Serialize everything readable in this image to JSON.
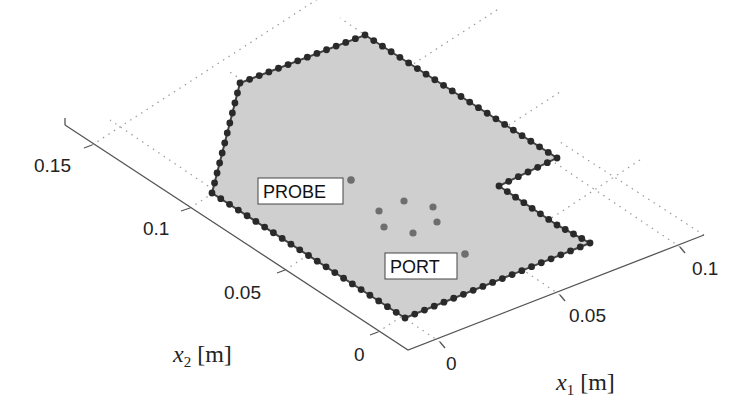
{
  "chart_data": {
    "type": "scatter",
    "title": "",
    "xlabel": "x_1 [m]",
    "ylabel": "x_2 [m]",
    "xlabel_main": "x",
    "xlabel_sub": "1",
    "xlabel_unit": "[m]",
    "ylabel_main": "x",
    "ylabel_sub": "2",
    "ylabel_unit": "[m]",
    "x_ticks": [
      "0",
      "0.05",
      "0.1"
    ],
    "y_ticks": [
      "0",
      "0.05",
      "0.1",
      "0.15"
    ],
    "xlim": [
      0,
      0.11
    ],
    "ylim": [
      0,
      0.17
    ],
    "grid": "dotted",
    "view": "3D perspective",
    "domain_shape": "polygon with rectangular notch, boundary discretized by dots",
    "polygon_vertices_m": [
      [
        0.0,
        0.0
      ],
      [
        0.1,
        0.0
      ],
      [
        0.1,
        0.05
      ],
      [
        0.08,
        0.05
      ],
      [
        0.08,
        0.065
      ],
      [
        0.1,
        0.065
      ],
      [
        0.1,
        0.1
      ],
      [
        0.05,
        0.16
      ],
      [
        0.015,
        0.145
      ],
      [
        0.0,
        0.105
      ]
    ],
    "sources": [
      {
        "name": "PROBE",
        "x": 0.03,
        "y": 0.09
      },
      {
        "name": "PORT",
        "x": 0.06,
        "y": 0.03
      }
    ],
    "ring_points_m": [
      [
        0.035,
        0.07
      ],
      [
        0.045,
        0.075
      ],
      [
        0.055,
        0.07
      ],
      [
        0.055,
        0.06
      ],
      [
        0.045,
        0.055
      ],
      [
        0.035,
        0.06
      ]
    ],
    "colors": {
      "fill": "#cfcfcf",
      "boundary_dot": "#2a2a2a",
      "interior_dot": "#6e6e6e"
    }
  },
  "annotations": {
    "probe": "PROBE",
    "port": "PORT"
  }
}
